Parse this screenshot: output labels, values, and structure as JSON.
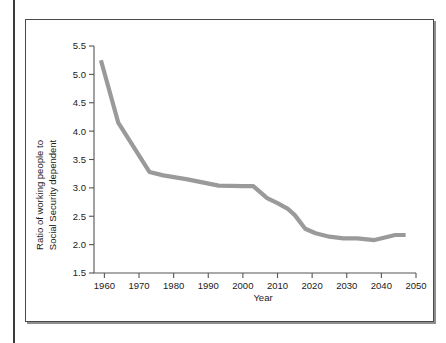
{
  "figure": {
    "panel_border_color": "#4a4a4a",
    "background": "#ffffff"
  },
  "chart_data": {
    "type": "line",
    "title": "",
    "xlabel": "Year",
    "ylabel": "Ratio of working people to Social Security dependent",
    "ylabel_lines": [
      "Ratio of working people to",
      "Social Security dependent"
    ],
    "xlim": [
      1957,
      2050
    ],
    "ylim": [
      1.5,
      5.5
    ],
    "xticks": [
      1960,
      1970,
      1980,
      1990,
      2000,
      2010,
      2020,
      2030,
      2040,
      2050
    ],
    "xtick_labels": [
      "1960",
      "1970",
      "1980",
      "1990",
      "2000",
      "2010",
      "2020",
      "2030",
      "2040",
      "2050"
    ],
    "yticks": [
      1.5,
      2.0,
      2.5,
      3.0,
      3.5,
      4.0,
      4.5,
      5.0,
      5.5
    ],
    "ytick_labels": [
      "1.5",
      "2.0",
      "2.5",
      "3.0",
      "3.5",
      "4.0",
      "4.5",
      "5.0",
      "5.5"
    ],
    "grid": false,
    "legend": false,
    "line_color": "#9a9a9a",
    "line_width": 4.2,
    "series": [
      {
        "name": "Ratio of working people to Social Security dependent",
        "x": [
          1959,
          1964,
          1973,
          1977,
          1984,
          1993,
          2000,
          2003,
          2007,
          2010,
          2013,
          2015,
          2018,
          2021,
          2025,
          2029,
          2033,
          2038,
          2044,
          2047
        ],
        "values": [
          5.25,
          4.15,
          3.28,
          3.22,
          3.15,
          3.04,
          3.03,
          3.03,
          2.82,
          2.73,
          2.63,
          2.52,
          2.28,
          2.2,
          2.14,
          2.11,
          2.11,
          2.08,
          2.17,
          2.17
        ]
      }
    ]
  }
}
